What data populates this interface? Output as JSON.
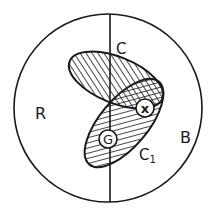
{
  "diagram": {
    "regions": {
      "left": {
        "label": "R"
      },
      "right": {
        "label": "B"
      }
    },
    "sets": {
      "c": {
        "label": "C"
      },
      "c1": {
        "label": "C",
        "subscript": "1"
      }
    },
    "points": {
      "x": {
        "label": "x"
      },
      "g": {
        "label": "G"
      }
    },
    "colors": {
      "stroke": "#1a1a1a",
      "background": "#ffffff"
    }
  }
}
